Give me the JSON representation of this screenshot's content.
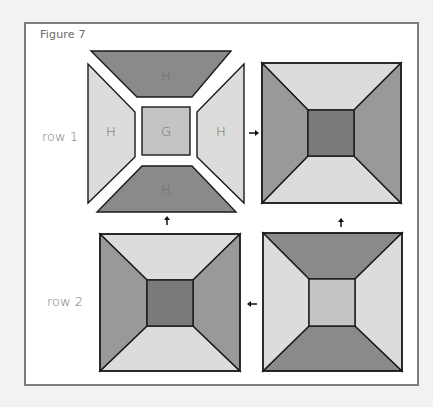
{
  "figure": {
    "title": "Figure 7"
  },
  "rows": [
    {
      "label": "row 1"
    },
    {
      "label": "row 2"
    }
  ],
  "pieces": {
    "top": "H",
    "left": "H",
    "center": "G",
    "right": "H",
    "bottom": "H"
  },
  "colors": {
    "dark": "#8a8a8a",
    "center_dark": "#7a7a7a",
    "light": "#dcdcdc",
    "center_light": "#c4c4c4",
    "outline": "#1a1a1a",
    "frame_border": "#7d7d7d"
  },
  "arrows": [
    {
      "direction": "right",
      "from": "exploded-block",
      "to": "assembled-block-1"
    },
    {
      "direction": "up",
      "from": "assembled-block-2",
      "to": "exploded-block"
    },
    {
      "direction": "up",
      "from": "assembled-block-4",
      "to": "assembled-block-1"
    },
    {
      "direction": "left",
      "from": "assembled-block-4",
      "to": "assembled-block-2"
    }
  ]
}
